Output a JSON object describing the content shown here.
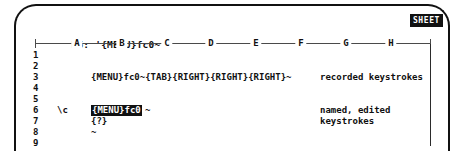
{
  "window": {
    "device": "crt-monitor-bezel"
  },
  "control_panel": {
    "cell_reference": "B6:",
    "cell_contents": "'{MENU}fc0~",
    "full_line": "B6: '{MENU}fc0~"
  },
  "mode_indicator": {
    "label": "SHEET",
    "style": "inverse-video",
    "bg": "#111111",
    "fg": "#ffffff"
  },
  "worksheet": {
    "column_headers": [
      "A",
      "B",
      "C",
      "D",
      "E",
      "F",
      "G",
      "H"
    ],
    "column_x": [
      44,
      89,
      134,
      178,
      223,
      268,
      313,
      358
    ],
    "row_numbers": [
      "1",
      "2",
      "3",
      "4",
      "5",
      "6",
      "7",
      "8",
      "9"
    ],
    "cells": [
      {
        "row": 3,
        "col": "B",
        "text": "{MENU}fc0~{TAB}{RIGHT}{RIGHT}{RIGHT}~",
        "highlighted": false
      },
      {
        "row": 6,
        "col": "A",
        "text": "\\c",
        "highlighted": false
      },
      {
        "row": 6,
        "col": "B",
        "text": "{MENU}fc0",
        "trailing": "~",
        "highlighted": true
      },
      {
        "row": 7,
        "col": "B",
        "text": "{?}",
        "highlighted": false
      },
      {
        "row": 8,
        "col": "B",
        "text": "~",
        "highlighted": false
      }
    ],
    "annotations": [
      {
        "row": 3,
        "lines": [
          "recorded keystrokes"
        ]
      },
      {
        "row": 6,
        "lines": [
          "named, edited"
        ]
      },
      {
        "row": 7,
        "lines": [
          "keystrokes"
        ]
      }
    ]
  }
}
